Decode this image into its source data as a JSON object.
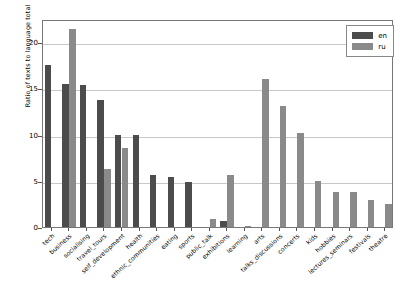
{
  "chart_data": {
    "type": "bar",
    "title": "",
    "xlabel": "",
    "ylabel": "Ratio of texts to language total",
    "ylim": [
      0,
      22.5
    ],
    "yticks": [
      0,
      5,
      10,
      15,
      20
    ],
    "ytick_labels": [
      "0",
      "5",
      "10",
      "15",
      "20"
    ],
    "grid": true,
    "legend_position": "upper right",
    "categories": [
      "tech",
      "business",
      "socialising",
      "travel_tours",
      "self_development",
      "health",
      "ethnic_communities",
      "eating",
      "sports",
      "public_talk",
      "exhibitions",
      "learning",
      "arts",
      "talks_discussions",
      "concerts",
      "kids",
      "hobbies",
      "lectures_seminars",
      "festivals",
      "theatre"
    ],
    "series": [
      {
        "name": "en",
        "color": "#4c4c4c",
        "values": [
          17.5,
          15.5,
          15.4,
          13.7,
          10.0,
          9.9,
          5.6,
          5.4,
          4.9,
          0,
          0.6,
          0,
          0,
          0,
          0,
          0,
          0,
          0,
          0,
          0
        ]
      },
      {
        "name": "ru",
        "color": "#8a8a8a",
        "values": [
          0,
          21.4,
          0,
          6.3,
          8.5,
          0,
          0,
          0,
          0,
          0.9,
          5.6,
          0.15,
          16.0,
          13.1,
          10.2,
          5.0,
          3.8,
          3.8,
          2.9,
          2.5
        ]
      }
    ]
  },
  "legend": {
    "entries": [
      {
        "label": "en",
        "color": "#4c4c4c"
      },
      {
        "label": "ru",
        "color": "#8a8a8a"
      }
    ]
  }
}
